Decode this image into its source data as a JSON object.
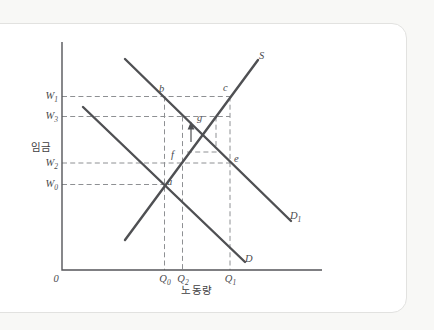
{
  "colors": {
    "page_bg": "#f8f8f6",
    "card_bg": "#ffffff",
    "card_border": "#e2e2e0",
    "axis": "#55565a",
    "curve": "#4f5053",
    "dash": "#8e9093",
    "text": "#4a4b4e"
  },
  "axes": {
    "origin": "0",
    "x_label": "노동량",
    "y_label": "임금"
  },
  "y_ticks": [
    {
      "base": "W",
      "sub": "1"
    },
    {
      "base": "W",
      "sub": "3"
    },
    {
      "base": "W",
      "sub": "2"
    },
    {
      "base": "W",
      "sub": "0"
    }
  ],
  "x_ticks": [
    {
      "base": "Q",
      "sub": "0"
    },
    {
      "base": "Q",
      "sub": "2"
    },
    {
      "base": "Q",
      "sub": "1"
    }
  ],
  "curves": {
    "supply": {
      "base": "S",
      "sub": ""
    },
    "demand": {
      "base": "D",
      "sub": ""
    },
    "demand_new": {
      "base": "D",
      "sub": "1"
    }
  },
  "points": {
    "a": "a",
    "b": "b",
    "c": "c",
    "e": "e",
    "f": "f",
    "g": "g"
  }
}
